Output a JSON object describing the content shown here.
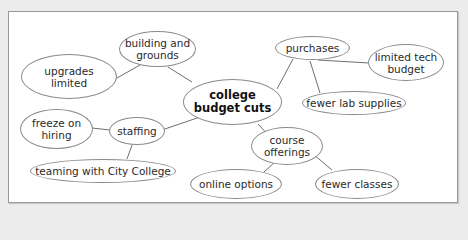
{
  "diagram": {
    "type": "mind-map",
    "center": {
      "id": "center",
      "label": "college\nbudget cuts"
    },
    "nodes": [
      {
        "id": "building",
        "label": "building and\ngrounds"
      },
      {
        "id": "upgrades",
        "label": "upgrades\nlimited"
      },
      {
        "id": "purchases",
        "label": "purchases"
      },
      {
        "id": "techbudget",
        "label": "limited tech\nbudget"
      },
      {
        "id": "labsupplies",
        "label": "fewer lab supplies"
      },
      {
        "id": "staffing",
        "label": "staffing"
      },
      {
        "id": "freeze",
        "label": "freeze on\nhiring"
      },
      {
        "id": "teaming",
        "label": "teaming with City College"
      },
      {
        "id": "course",
        "label": "course\nofferings"
      },
      {
        "id": "online",
        "label": "online options"
      },
      {
        "id": "fewerclasses",
        "label": "fewer classes"
      }
    ],
    "edges": [
      [
        "center",
        "building"
      ],
      [
        "building",
        "upgrades"
      ],
      [
        "center",
        "purchases"
      ],
      [
        "purchases",
        "techbudget"
      ],
      [
        "purchases",
        "labsupplies"
      ],
      [
        "center",
        "staffing"
      ],
      [
        "staffing",
        "freeze"
      ],
      [
        "staffing",
        "teaming"
      ],
      [
        "center",
        "course"
      ],
      [
        "course",
        "online"
      ],
      [
        "course",
        "fewerclasses"
      ]
    ],
    "colors": {
      "background": "#ececec",
      "panel": "#ffffff",
      "border": "#8a8a8a",
      "line": "#6e6e6e",
      "text": "#2a2a2a"
    }
  }
}
